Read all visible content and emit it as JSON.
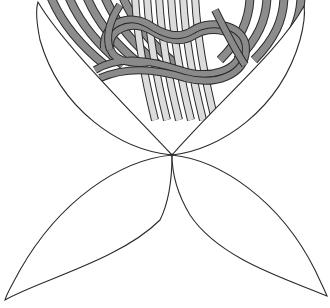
{
  "illustration": {
    "title": "",
    "description": "Four-petal line drawing with knotted rope bands in upper region",
    "petals": [
      "top-left-petal",
      "top-right-petal",
      "bottom-left-petal",
      "bottom-right-petal"
    ],
    "colors": {
      "background": "#ffffff",
      "outline": "#2b2b2b",
      "dark_band": "#8c8c8c",
      "light_band": "#dcdcdc",
      "rope": "#8a8a8a"
    }
  }
}
